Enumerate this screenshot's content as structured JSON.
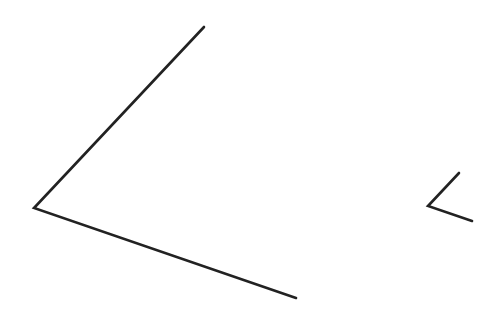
{
  "diagram": {
    "background": "#ffffff",
    "stroke_color": "#222222",
    "angles": [
      {
        "name": "large-angle",
        "vertex": [
          34,
          208
        ],
        "ray_a_end": [
          204,
          27
        ],
        "ray_b_end": [
          296,
          298
        ],
        "stroke_width": 2.6
      },
      {
        "name": "small-angle",
        "vertex": [
          428,
          206
        ],
        "ray_a_end": [
          459,
          173
        ],
        "ray_b_end": [
          472,
          221
        ],
        "stroke_width": 2.6
      }
    ]
  }
}
